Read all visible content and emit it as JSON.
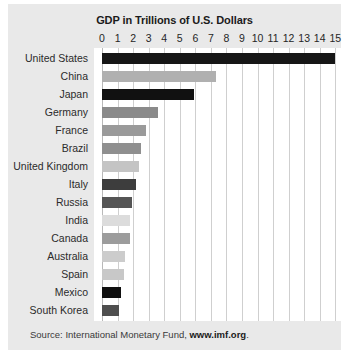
{
  "card": {
    "title": "GDP in Trillions of U.S. Dollars",
    "source_prefix": "Source: International Monetary Fund, ",
    "source_link": "www.imf.org",
    "source_suffix": "."
  },
  "colors": {
    "card_background": "#e9e9e9",
    "plot_background": "#ffffff",
    "gridline": "#cfcfcf",
    "text": "#1b1b1b"
  },
  "chart_data": {
    "type": "bar",
    "orientation": "horizontal",
    "title": "GDP in Trillions of U.S. Dollars",
    "xlabel": "",
    "ylabel": "",
    "xlim": [
      0,
      15.3
    ],
    "grid": true,
    "legend": "none",
    "tick_labels": [
      "0",
      "1",
      "2",
      "3",
      "4",
      "5",
      "6",
      "7",
      "8",
      "9",
      "10",
      "11",
      "12",
      "13",
      "14",
      "15"
    ],
    "ticks": [
      0,
      1,
      2,
      3,
      4,
      5,
      6,
      7,
      8,
      9,
      10,
      11,
      12,
      13,
      14,
      15
    ],
    "categories": [
      "United States",
      "China",
      "Japan",
      "Germany",
      "France",
      "Brazil",
      "United Kingdom",
      "Italy",
      "Russia",
      "India",
      "Canada",
      "Australia",
      "Spain",
      "Mexico",
      "South Korea"
    ],
    "values": [
      15.0,
      7.3,
      5.9,
      3.6,
      2.8,
      2.5,
      2.4,
      2.2,
      1.9,
      1.8,
      1.8,
      1.5,
      1.4,
      1.2,
      1.1
    ],
    "bar_colors": [
      "#161616",
      "#b0b0b0",
      "#111111",
      "#8a8a8a",
      "#9a9a9a",
      "#8f8f8f",
      "#c4c4c4",
      "#3d3d3d",
      "#555555",
      "#dcdcdc",
      "#9c9c9c",
      "#cccccc",
      "#c8c8c8",
      "#101010",
      "#4e4e4e"
    ]
  }
}
